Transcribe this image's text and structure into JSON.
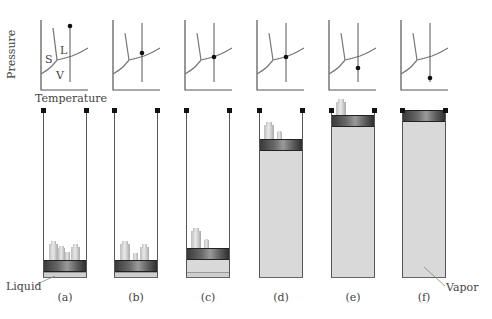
{
  "figure": {
    "axis_labels": {
      "y": "Pressure",
      "x": "Temperature"
    },
    "region_labels": {
      "solid": "S",
      "liquid": "L",
      "vapor": "V"
    },
    "panels": [
      {
        "id": "a",
        "caption": "(a)",
        "state_point": "top of isotherm (high pressure, liquid)",
        "piston_position": "bottom",
        "weights": 4,
        "contents": "liquid"
      },
      {
        "id": "b",
        "caption": "(b)",
        "state_point": "liquid region, just above vapor curve",
        "piston_position": "bottom",
        "weights": 3,
        "contents": "liquid"
      },
      {
        "id": "c",
        "caption": "(c)",
        "state_point": "on vapor-pressure curve",
        "piston_position": "low",
        "weights": 2,
        "contents": "liquid + vapor"
      },
      {
        "id": "d",
        "caption": "(d)",
        "state_point": "on vapor-pressure curve",
        "piston_position": "high",
        "weights": 2,
        "contents": "vapor"
      },
      {
        "id": "e",
        "caption": "(e)",
        "state_point": "just below vapor curve",
        "piston_position": "near top",
        "weights": 1,
        "contents": "vapor"
      },
      {
        "id": "f",
        "caption": "(f)",
        "state_point": "low pressure, vapor",
        "piston_position": "top",
        "weights": 0,
        "contents": "vapor"
      }
    ],
    "callouts": {
      "liquid": "Liquid",
      "vapor": "Vapor"
    }
  }
}
